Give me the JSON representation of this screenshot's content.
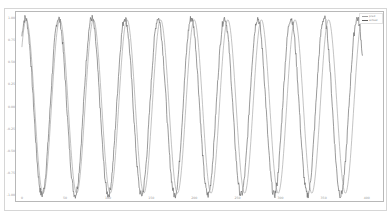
{
  "chart_data": {
    "type": "line",
    "title": "",
    "xlabel": "",
    "ylabel": "",
    "x_ticks": [
      "0",
      "50",
      "100",
      "150",
      "200",
      "250",
      "300",
      "350",
      "400"
    ],
    "y_ticks": [
      "1.00",
      "0.75",
      "0.50",
      "0.25",
      "0.00",
      "-0.25",
      "-0.50",
      "-0.75",
      "-1.00"
    ],
    "xlim": [
      -8,
      420
    ],
    "ylim": [
      -1.08,
      1.08
    ],
    "legend_position": "upper right",
    "grid": false,
    "series": [
      {
        "name": "pred",
        "color": "#9a9a9a",
        "description": "smooth sinusoid, amplitude ~1.0, period ~38.5 samples, slight phase lag growing to the right"
      },
      {
        "name": "actual",
        "color": "#6f6f6f",
        "description": "noisy sinusoid, amplitude ~1.0, period ~38.5 samples"
      }
    ],
    "periods_visible": 10,
    "peaks_x_approx": [
      4,
      42,
      81,
      119,
      158,
      196,
      235,
      273,
      312,
      350
    ],
    "peak_value": 1.0,
    "trough_value": -1.0
  },
  "legend": {
    "items": [
      {
        "label": "pred",
        "color": "#a0a0a0"
      },
      {
        "label": "actual",
        "color": "#5f5f5f"
      }
    ]
  }
}
